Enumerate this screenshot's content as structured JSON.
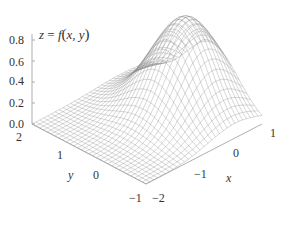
{
  "chart_data": {
    "type": "surface3d",
    "title": "z = f(x, y)",
    "title_parts": {
      "lhs": "z",
      "eq": " = ",
      "fn": "f",
      "open": "(",
      "args": "x, y",
      "close": ")"
    },
    "xlabel": "x",
    "ylabel": "y",
    "zlabel": "",
    "xlim": [
      -2,
      1
    ],
    "ylim": [
      -1,
      2
    ],
    "zlim": [
      0,
      0.9
    ],
    "x_ticks": [
      "−2",
      "−1",
      "0",
      "1"
    ],
    "y_ticks": [
      "2",
      "1",
      "0",
      "−1"
    ],
    "z_ticks": [
      "0.0",
      "0.2",
      "0.4",
      "0.6",
      "0.8"
    ],
    "function_approx": "z ≈ 0.9·exp(−1.1·((x−0.3)² + (y−0.3)²)) (bell-shaped peak ≈0.9 near x≈0.3, y≈0.3)",
    "peak": {
      "x": 0.3,
      "y": 0.3,
      "z": 0.9
    },
    "grid": "wireframe mesh",
    "mesh_color": "#8a8a8a",
    "axis_color": "#9a9a9a"
  }
}
